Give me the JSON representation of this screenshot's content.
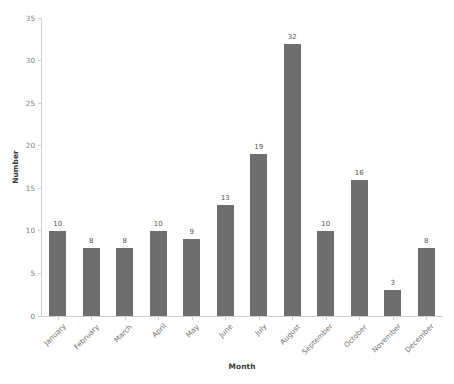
{
  "chart_data": {
    "type": "bar",
    "title": "",
    "xlabel": "Month",
    "ylabel": "Number",
    "categories": [
      "January",
      "February",
      "March",
      "April",
      "May",
      "June",
      "July",
      "August",
      "September",
      "October",
      "November",
      "December"
    ],
    "values": [
      10,
      8,
      8,
      10,
      9,
      13,
      19,
      32,
      10,
      16,
      3,
      8
    ],
    "value_labels": [
      "10",
      "8",
      "8",
      "10",
      "9",
      "13",
      "19",
      "32",
      "10",
      "16",
      "3",
      "8"
    ],
    "ylim": [
      0,
      35
    ],
    "yticks": [
      0,
      5,
      10,
      15,
      20,
      25,
      30,
      35
    ],
    "ytick_labels": [
      "0",
      "5",
      "10",
      "15",
      "20",
      "25",
      "30",
      "35"
    ],
    "xtick_rotation": -45,
    "grid": false,
    "legend": false,
    "bar_color": "#6e6e6e",
    "background_color": "#ffffff",
    "axis_color": "#cfcfcf",
    "tick_label_color": "#7a7a7a",
    "axis_title_color": "#3b3b3b",
    "value_label_color": "#545454"
  }
}
